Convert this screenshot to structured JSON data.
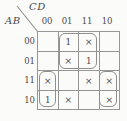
{
  "kmap": {
    "title": "Karnaugh map",
    "row_var": "AB",
    "col_var": "CD",
    "col_headers": [
      "00",
      "01",
      "11",
      "10"
    ],
    "row_headers": [
      "00",
      "01",
      "11",
      "10"
    ],
    "cells": [
      [
        "",
        "1",
        "×",
        ""
      ],
      [
        "",
        "×",
        "1",
        ""
      ],
      [
        "×",
        "",
        "×",
        "×"
      ],
      [
        "1",
        "×",
        "",
        "×"
      ]
    ],
    "groups": [
      {
        "label": "group-center-2x2",
        "rows": [
          0,
          1
        ],
        "cols": [
          1,
          2
        ]
      },
      {
        "label": "group-left-column-pair",
        "rows": [
          2,
          3
        ],
        "cols": [
          0,
          0
        ]
      },
      {
        "label": "group-right-column-pair",
        "rows": [
          2,
          3
        ],
        "cols": [
          3,
          3
        ]
      }
    ],
    "colors": {
      "background": "#fbfbf9",
      "line": "#979797",
      "loop": "#8f8f8f",
      "text": "#4a4a4a",
      "glyph": "#4f4f4f"
    }
  }
}
